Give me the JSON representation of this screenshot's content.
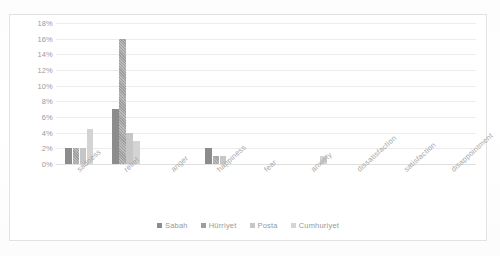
{
  "top_clipped_text": "",
  "chart_data": {
    "type": "bar",
    "title": "",
    "subtitle": "",
    "xlabel": "",
    "ylabel": "",
    "ylim": [
      0,
      18
    ],
    "ytick_labels": [
      "18%",
      "16%",
      "14%",
      "12%",
      "10%",
      "8%",
      "6%",
      "4%",
      "2%",
      "0%"
    ],
    "ytick_values": [
      18,
      16,
      14,
      12,
      10,
      8,
      6,
      4,
      2,
      0
    ],
    "grid": "horizontal",
    "legend_position": "bottom-center",
    "categories": [
      "sadness",
      "relief",
      "anger",
      "happiness",
      "fear",
      "anxiety",
      "dissatisfaction",
      "satisfaction",
      "disappointment"
    ],
    "series": [
      {
        "name": "Sabah",
        "color": "#8c8c8c",
        "values": [
          2.0,
          7.0,
          0,
          2.0,
          0,
          0,
          0,
          0,
          0
        ]
      },
      {
        "name": "Hürriyet",
        "color": "#9e9e9e",
        "values": [
          2.0,
          16.0,
          0,
          1.0,
          0,
          0,
          0,
          0,
          0
        ]
      },
      {
        "name": "Posta",
        "color": "#c6c6c6",
        "values": [
          2.0,
          4.0,
          0,
          1.0,
          0,
          0,
          0,
          0,
          0
        ]
      },
      {
        "name": "Cumhuriyet",
        "color": "#d4d4d4",
        "values": [
          4.5,
          3.0,
          0,
          0,
          0,
          1.0,
          0,
          0,
          0
        ]
      }
    ]
  }
}
